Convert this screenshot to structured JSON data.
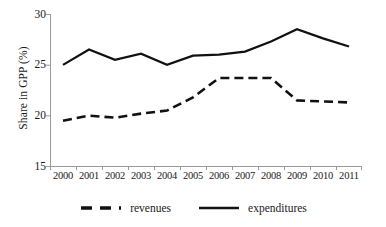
{
  "chart_data": {
    "type": "line",
    "title": "",
    "xlabel": "",
    "ylabel": "Share in GPP (%)",
    "categories": [
      "2000",
      "2001",
      "2002",
      "2003",
      "2004",
      "2005",
      "2006",
      "2007",
      "2008",
      "2009",
      "2010",
      "2011"
    ],
    "ylim": [
      15,
      30
    ],
    "yticks": [
      15,
      20,
      25,
      30
    ],
    "ytick_labels": [
      "15",
      "20",
      "25",
      "30"
    ],
    "grid": false,
    "legend_position": "bottom",
    "series": [
      {
        "name": "revenues",
        "style": "dashed",
        "color": "#000000",
        "values": [
          19.5,
          20.0,
          19.8,
          20.2,
          20.5,
          21.8,
          23.7,
          23.7,
          23.7,
          21.5,
          21.4,
          21.3
        ]
      },
      {
        "name": "expenditures",
        "style": "solid",
        "color": "#000000",
        "values": [
          25.0,
          26.5,
          25.5,
          26.1,
          25.0,
          25.9,
          26.0,
          26.3,
          27.3,
          28.5,
          27.6,
          26.8
        ]
      }
    ]
  },
  "axes": {
    "y_title": "Share in GPP (%)",
    "y_tick_labels": [
      "30",
      "25",
      "20",
      "15"
    ],
    "x_tick_labels": [
      "2000",
      "2001",
      "2002",
      "2003",
      "2004",
      "2005",
      "2006",
      "2007",
      "2008",
      "2009",
      "2010",
      "2011"
    ]
  },
  "legend": {
    "items": [
      {
        "label": "revenues",
        "swatch": "dashed-line-icon"
      },
      {
        "label": "expenditures",
        "swatch": "solid-line-icon"
      }
    ]
  },
  "colors": {
    "line": "#000000",
    "axis": "#808080",
    "text": "#1a1a1a",
    "background": "#ffffff"
  }
}
